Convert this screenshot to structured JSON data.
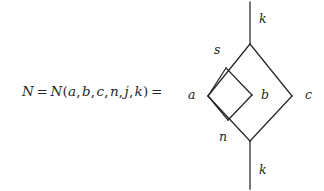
{
  "figure": {
    "kind": "spin-network-diagram",
    "formula": {
      "lhs": "N",
      "equals_1": "=",
      "fn_name": "N",
      "open_paren": "(",
      "args": [
        "a",
        "b",
        "c",
        "n",
        "j",
        "k"
      ],
      "comma": ",",
      "close_paren": ")",
      "equals_2": "=",
      "full_text": "N = N(a,b,c,n,j,k) ="
    },
    "labels": {
      "top_leg": "k",
      "bottom_leg": "k",
      "upper_left_edge": "s",
      "lower_left_edge": "n",
      "left_vertex": "a",
      "middle": "b",
      "right_vertex": "c"
    },
    "colors": {
      "ink": "#262626",
      "background": "#ffffff"
    },
    "geometry": {
      "top_vertex": [
        250,
        44
      ],
      "left_vertex": [
        208,
        96
      ],
      "right_vertex": [
        292,
        96
      ],
      "bottom_vertex": [
        250,
        141
      ],
      "top_leg_end": [
        250,
        2
      ],
      "bottom_leg_end": [
        250,
        189
      ],
      "inner_top": [
        226,
        68
      ],
      "inner_right": [
        252,
        95
      ],
      "inner_bottom": [
        228,
        120
      ],
      "stroke_width": 1.25
    }
  }
}
